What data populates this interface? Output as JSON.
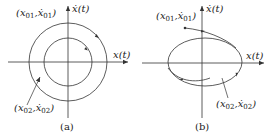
{
  "panels": [
    {
      "id": "a",
      "caption": "(a)",
      "x_axis_label": "x(t)",
      "y_axis_label": "ẋ(t)",
      "initial_point_1": {
        "label_base": "(x",
        "sub1": "01",
        "mid": ",ẋ",
        "sub2": "01",
        "end": ")"
      },
      "initial_point_2": {
        "label_base": "(x",
        "sub1": "02",
        "mid": ",ẋ",
        "sub2": "02",
        "end": ")"
      },
      "trajectories": [
        "outer circle (closed orbit, clockwise)",
        "inner circle (closed orbit, clockwise)"
      ]
    },
    {
      "id": "b",
      "caption": "(b)",
      "x_axis_label": "x(t)",
      "y_axis_label": "ẋ(t)",
      "initial_point_1": {
        "label_base": "(x",
        "sub1": "01",
        "mid": ",ẋ",
        "sub2": "01",
        "end": ")"
      },
      "initial_point_2": {
        "label_base": "(x",
        "sub1": "02",
        "mid": ",ẋ",
        "sub2": "02",
        "end": ")"
      },
      "trajectories": [
        "limit cycle (ellipse, clockwise)",
        "trajectory from outside converging",
        "trajectory from inside spiraling out"
      ]
    }
  ],
  "colors": {
    "stroke": "#333333",
    "background": "#ffffff"
  }
}
